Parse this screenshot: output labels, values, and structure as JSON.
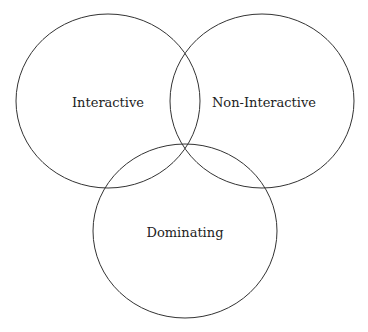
{
  "diagram": {
    "type": "venn",
    "sets": [
      {
        "label": "Interactive",
        "cx": 108,
        "cy": 101,
        "rx": 92,
        "ry": 87
      },
      {
        "label": "Non-Interactive",
        "cx": 262,
        "cy": 101,
        "rx": 92,
        "ry": 87
      },
      {
        "label": "Dominating",
        "cx": 185,
        "cy": 231,
        "rx": 92,
        "ry": 87
      }
    ],
    "stroke_color": "#333333"
  }
}
